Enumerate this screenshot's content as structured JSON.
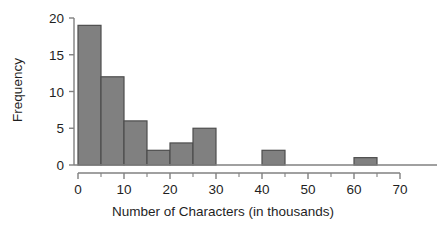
{
  "chart_data": {
    "type": "bar",
    "title": "",
    "xlabel": "Number of Characters (in thousands)",
    "ylabel": "Frequency",
    "xlim": [
      0,
      70
    ],
    "ylim": [
      0,
      20
    ],
    "grid": false,
    "legend": null,
    "bin_width": 5,
    "bin_edges": [
      0,
      5,
      10,
      15,
      20,
      25,
      30,
      40,
      45,
      60,
      65
    ],
    "categories": [
      "0-5",
      "5-10",
      "10-15",
      "15-20",
      "20-25",
      "25-30",
      "40-45",
      "60-65"
    ],
    "values": [
      19,
      12,
      6,
      2,
      3,
      5,
      2,
      1
    ],
    "bars": [
      {
        "x0": 0,
        "x1": 5,
        "value": 19
      },
      {
        "x0": 5,
        "x1": 10,
        "value": 12
      },
      {
        "x0": 10,
        "x1": 15,
        "value": 6
      },
      {
        "x0": 15,
        "x1": 20,
        "value": 2
      },
      {
        "x0": 20,
        "x1": 25,
        "value": 3
      },
      {
        "x0": 25,
        "x1": 30,
        "value": 5
      },
      {
        "x0": 40,
        "x1": 45,
        "value": 2
      },
      {
        "x0": 60,
        "x1": 65,
        "value": 1
      }
    ],
    "xticks": [
      0,
      10,
      20,
      30,
      40,
      50,
      60,
      70
    ],
    "xtick_labels": [
      "0",
      "10",
      "20",
      "30",
      "40",
      "50",
      "60",
      "70"
    ],
    "xminor_ticks": [
      5,
      15,
      25,
      35,
      45,
      55,
      65
    ],
    "yticks": [
      0,
      5,
      10,
      15,
      20
    ],
    "ytick_labels": [
      "0",
      "5",
      "10",
      "15",
      "20"
    ],
    "colors": {
      "bar_fill": "#808080",
      "bar_edge": "#4d4d4d",
      "axis": "#808080",
      "text": "#1f1f1f",
      "background": "#ffffff"
    }
  }
}
